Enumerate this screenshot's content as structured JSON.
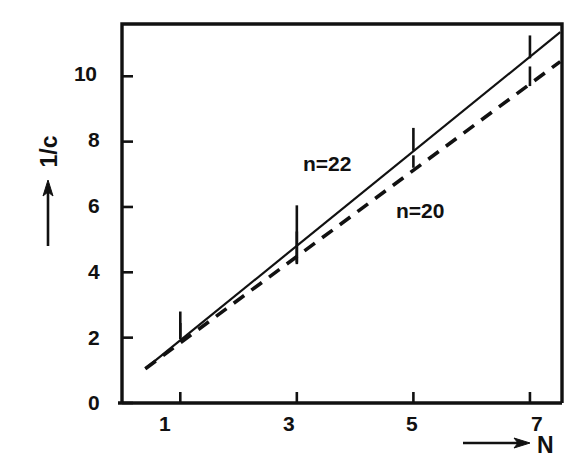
{
  "figure": {
    "background_color": "#ffffff",
    "ink_color": "#111111"
  },
  "chart_data": {
    "type": "line",
    "title": "",
    "subtitle": "",
    "xlabel": "N",
    "ylabel": "1/c",
    "xlabel_prefix_arrow": "→",
    "ylabel_arrow": "↑",
    "xlim": [
      0,
      7.55
    ],
    "ylim": [
      0,
      11.6
    ],
    "xticks": [
      1,
      3,
      5,
      7
    ],
    "xtick_labels": [
      "1",
      "3",
      "5",
      "7"
    ],
    "yticks": [
      0,
      2,
      4,
      6,
      8,
      10
    ],
    "ytick_labels": [
      "0",
      "2",
      "4",
      "6",
      "8",
      "10"
    ],
    "grid": false,
    "legend_position": "inline-annotations",
    "frame": "box",
    "series": [
      {
        "name": "n=22",
        "label": "n=22",
        "linestyle": "solid",
        "color": "#111111",
        "fit_x": [
          0.4,
          7.52
        ],
        "fit_y": [
          1.05,
          11.35
        ],
        "x": [
          1,
          3,
          5,
          7
        ],
        "values": [
          2.38,
          5.2,
          8.05,
          10.9
        ],
        "yerr_low": [
          1.95,
          4.3,
          7.72,
          10.55
        ],
        "yerr_high": [
          2.8,
          6.05,
          8.42,
          11.25
        ]
      },
      {
        "name": "n=20",
        "label": "n=20",
        "linestyle": "dashed",
        "color": "#111111",
        "fit_x": [
          0.4,
          7.52
        ],
        "fit_y": [
          1.05,
          10.45
        ],
        "x": [
          1,
          3,
          5,
          7
        ],
        "values": [
          2.2,
          4.75,
          7.38,
          10.0
        ],
        "yerr_low": [
          2.0,
          4.25,
          7.2,
          9.7
        ],
        "yerr_high": [
          2.45,
          5.25,
          7.58,
          10.3
        ]
      }
    ],
    "annotations": [
      {
        "text": "n=22",
        "x_px": 303,
        "y_px": 152
      },
      {
        "text": "n=20",
        "x_px": 396,
        "y_px": 199
      }
    ]
  }
}
